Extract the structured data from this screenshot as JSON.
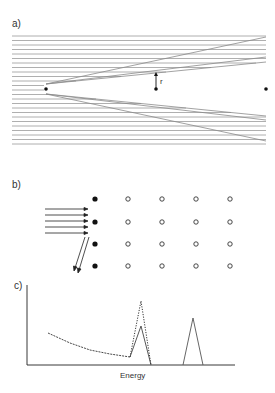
{
  "panels": {
    "a": {
      "label": "a)",
      "annotation": "r",
      "line_color": "#9a9a9a",
      "horizontal_line_ys": [
        36,
        40.5,
        45,
        49.5,
        54,
        58.5,
        63,
        67.5,
        72,
        76.5,
        81,
        85.5,
        90,
        94.5,
        99,
        103.5,
        108,
        112.5,
        117,
        121.5,
        126,
        130.5,
        135,
        139.5,
        144
      ],
      "focus_point": {
        "x": 46,
        "y": 89
      },
      "center_point": {
        "x": 156,
        "y": 89
      },
      "right_point": {
        "x": 266,
        "y": 89
      }
    },
    "b": {
      "label": "b)",
      "rows": 4,
      "columns": 5,
      "first_column": "filled",
      "other_columns": "hollow",
      "incoming_arrows": 5,
      "reflected_arrows": 2
    },
    "c": {
      "label": "c)",
      "xlabel": "Energy"
    }
  },
  "chart_data": {
    "type": "line",
    "title": "",
    "xlabel": "Energy",
    "ylabel": "",
    "grid": false,
    "series": [
      {
        "name": "solid",
        "style": "solid",
        "points": [
          [
            0.1,
            0.45
          ],
          [
            0.5,
            0.12
          ],
          [
            0.55,
            0.55
          ],
          [
            0.6,
            0.0
          ]
        ]
      },
      {
        "name": "dotted",
        "style": "dotted",
        "points": [
          [
            0.1,
            0.45
          ],
          [
            0.5,
            0.12
          ],
          [
            0.55,
            0.8
          ],
          [
            0.6,
            0.0
          ]
        ]
      },
      {
        "name": "second peak",
        "style": "solid",
        "points": [
          [
            0.75,
            0.0
          ],
          [
            0.8,
            0.6
          ],
          [
            0.85,
            0.0
          ]
        ]
      }
    ]
  }
}
